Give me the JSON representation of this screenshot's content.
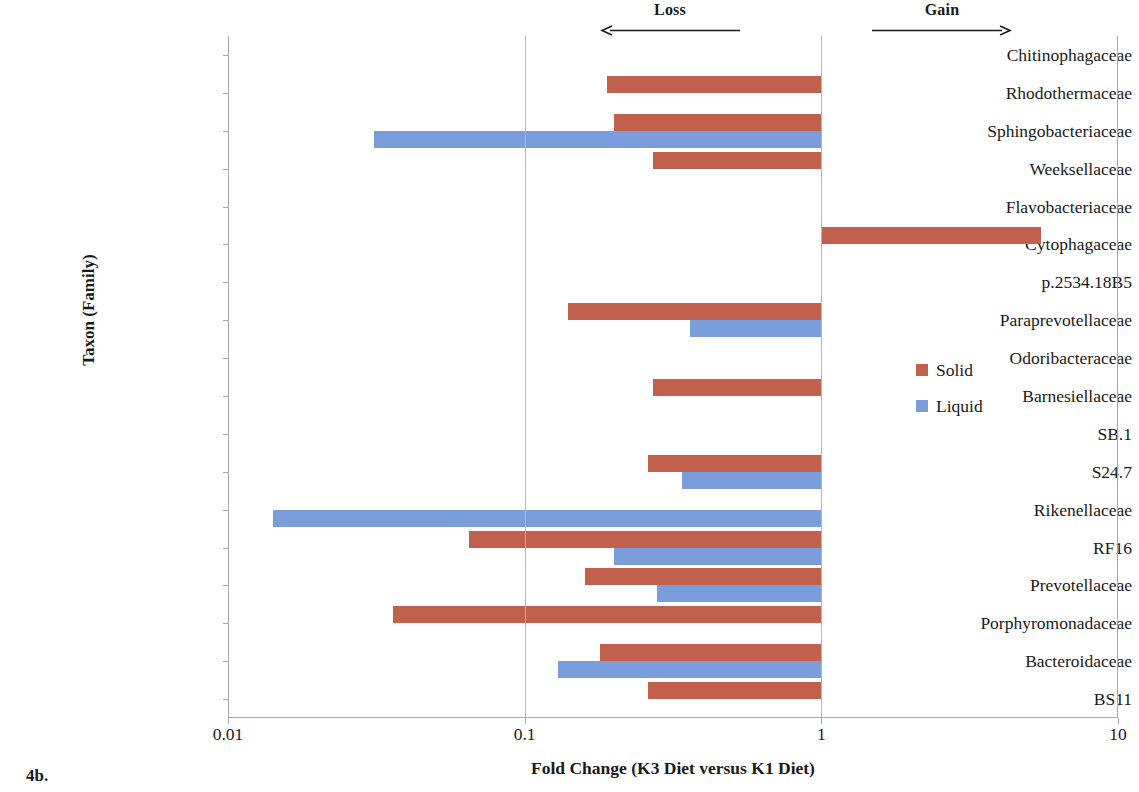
{
  "axes": {
    "ylabel": "Taxon (Family)",
    "xlabel": "Fold Change (K3 Diet versus K1 Diet)",
    "xticks": [
      "0.01",
      "0.1",
      "1",
      "10"
    ]
  },
  "annotations": {
    "loss": "Loss",
    "gain": "Gain"
  },
  "legend": {
    "items": [
      {
        "label": "Solid",
        "color": "#c0604d"
      },
      {
        "label": "Liquid",
        "color": "#7a9ddb"
      }
    ]
  },
  "caption": "4b.",
  "chart_data": {
    "type": "bar",
    "orientation": "horizontal",
    "title": "",
    "xlabel": "Fold Change (K3 Diet versus K1 Diet)",
    "ylabel": "Taxon (Family)",
    "xscale": "log",
    "xlim": [
      0.01,
      10
    ],
    "xticks": [
      0.01,
      0.1,
      1,
      10
    ],
    "baseline": 1,
    "grid": true,
    "legend_position": "right-middle",
    "annotations": [
      {
        "text": "Loss",
        "direction": "left",
        "x_range": [
          0.16,
          0.54
        ]
      },
      {
        "text": "Gain",
        "direction": "right",
        "x_range": [
          1.55,
          5.2
        ]
      }
    ],
    "categories": [
      "Chitinophagaceae",
      "Rhodothermaceae",
      "Sphingobacteriaceae",
      "Weeksellaceae",
      "Flavobacteriaceae",
      "Cytophagaceae",
      "p.2534.18B5",
      "Paraprevotellaceae",
      "Odoribacteraceae",
      "Barnesiellaceae",
      "SB.1",
      "S24.7",
      "Rikenellaceae",
      "RF16",
      "Prevotellaceae",
      "Porphyromonadaceae",
      "Bacteroidaceae",
      "BS11"
    ],
    "series": [
      {
        "name": "Solid",
        "color": "#c0604d",
        "values": [
          null,
          0.19,
          0.2,
          0.27,
          null,
          5.5,
          null,
          0.14,
          null,
          0.27,
          null,
          0.26,
          null,
          0.065,
          0.16,
          0.036,
          0.18,
          0.26
        ]
      },
      {
        "name": "Liquid",
        "color": "#7a9ddb",
        "values": [
          null,
          null,
          0.031,
          null,
          null,
          null,
          null,
          0.36,
          null,
          null,
          null,
          0.34,
          0.0142,
          0.2,
          0.28,
          null,
          0.13,
          null
        ]
      }
    ]
  }
}
